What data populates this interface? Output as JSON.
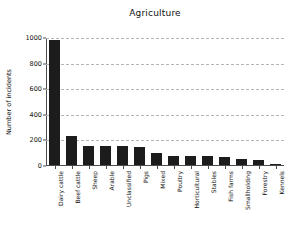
{
  "chart_data": {
    "type": "bar",
    "title": "Agriculture",
    "xlabel": "",
    "ylabel": "Number of incidents",
    "ylim": [
      0,
      1000
    ],
    "yticks": [
      0,
      200,
      400,
      600,
      800,
      1000
    ],
    "ytick_labels": [
      "0",
      "200",
      "400",
      "600",
      "800",
      "1000"
    ],
    "grid": "horizontal-dashed",
    "legend": "none",
    "bar_color": "#1c1c1c",
    "categories": [
      "Dairy cattle",
      "Beef cattle",
      "Sheep",
      "Arable",
      "Unclassified",
      "Pigs",
      "Mixed",
      "Poultry",
      "Horticultural",
      "Stables",
      "Fish farms",
      "Smallholding",
      "Forestry",
      "Kennels"
    ],
    "values": [
      980,
      230,
      152,
      148,
      145,
      140,
      95,
      72,
      70,
      68,
      62,
      48,
      38,
      4
    ]
  }
}
